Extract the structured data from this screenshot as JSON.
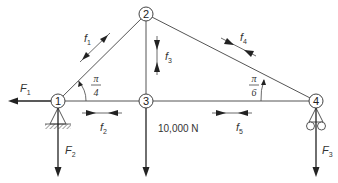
{
  "diagram": {
    "type": "truss",
    "nodes": [
      {
        "id": "1",
        "label": "1"
      },
      {
        "id": "2",
        "label": "2"
      },
      {
        "id": "3",
        "label": "3"
      },
      {
        "id": "4",
        "label": "4"
      }
    ],
    "members": [
      {
        "id": "f1",
        "label": "f",
        "sub": "1",
        "from": "1",
        "to": "2"
      },
      {
        "id": "f2",
        "label": "f",
        "sub": "2",
        "from": "1",
        "to": "3"
      },
      {
        "id": "f3",
        "label": "f",
        "sub": "3",
        "from": "2",
        "to": "3"
      },
      {
        "id": "f4",
        "label": "f",
        "sub": "4",
        "from": "2",
        "to": "4"
      },
      {
        "id": "f5",
        "label": "f",
        "sub": "5",
        "from": "3",
        "to": "4"
      }
    ],
    "external_forces": [
      {
        "id": "F1",
        "label": "F",
        "sub": "1",
        "node": "1",
        "direction": "left"
      },
      {
        "id": "F2",
        "label": "F",
        "sub": "2",
        "node": "1",
        "direction": "down"
      },
      {
        "id": "F3",
        "label": "F",
        "sub": "3",
        "node": "4",
        "direction": "down"
      }
    ],
    "applied_load": {
      "node": "3",
      "label": "10,000 N",
      "direction": "down"
    },
    "angles": [
      {
        "node": "1",
        "numerator": "π",
        "denominator": "4"
      },
      {
        "node": "4",
        "numerator": "π",
        "denominator": "6"
      }
    ],
    "supports": [
      {
        "node": "1",
        "type": "pin"
      },
      {
        "node": "4",
        "type": "roller"
      }
    ]
  }
}
